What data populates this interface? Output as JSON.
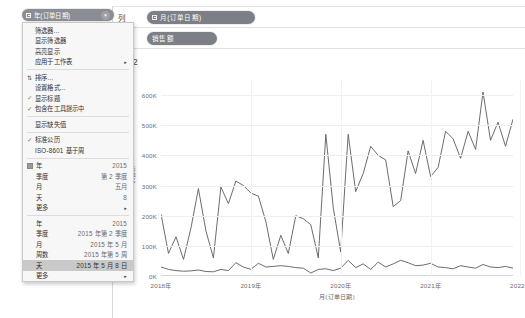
{
  "shelves": {
    "columns_label": "列",
    "rows_label": "行",
    "columns_pill": "月(订单日期)",
    "rows_pill": "销售额"
  },
  "sheet": {
    "title": "8-2"
  },
  "context_menu": {
    "header_pill": "年(订单日期)",
    "groups": [
      {
        "items": [
          {
            "label": "筛选器...",
            "value": "",
            "check": false,
            "arrow": false
          },
          {
            "label": "显示筛选器",
            "value": "",
            "check": false,
            "arrow": false
          },
          {
            "label": "高亮显示",
            "value": "",
            "check": false,
            "arrow": false
          },
          {
            "label": "应用于工作表",
            "value": "",
            "check": false,
            "arrow": true
          }
        ]
      },
      {
        "items": [
          {
            "label": "排序...",
            "value": "",
            "check": false,
            "arrow": false,
            "icon": "sort-icon"
          },
          {
            "label": "设置格式...",
            "value": "",
            "check": false,
            "arrow": false
          },
          {
            "label": "显示标题",
            "value": "",
            "check": true,
            "arrow": false
          },
          {
            "label": "包含在工具提示中",
            "value": "",
            "check": true,
            "arrow": false
          }
        ]
      },
      {
        "items": [
          {
            "label": "显示缺失值",
            "value": "",
            "check": false,
            "arrow": false
          }
        ]
      },
      {
        "items": [
          {
            "label": "标准公历",
            "value": "",
            "check": true,
            "arrow": false
          },
          {
            "label": "ISO-8601 基于周",
            "value": "",
            "check": false,
            "arrow": false
          }
        ]
      }
    ],
    "date_part_group": {
      "radio": true,
      "items": [
        {
          "label": "年",
          "value": "2015",
          "arrow": false
        },
        {
          "label": "季度",
          "value": "第 2 季度",
          "arrow": false
        },
        {
          "label": "月",
          "value": "五月",
          "arrow": false
        },
        {
          "label": "天",
          "value": "8",
          "arrow": false
        },
        {
          "label": "更多",
          "value": "",
          "arrow": true
        }
      ]
    },
    "date_value_group": {
      "items": [
        {
          "label": "年",
          "value": "2015",
          "arrow": false,
          "selected": false
        },
        {
          "label": "季度",
          "value": "2015 年第 2 季度",
          "arrow": false,
          "selected": false
        },
        {
          "label": "月",
          "value": "2015 年 5 月",
          "arrow": false,
          "selected": false
        },
        {
          "label": "周数",
          "value": "2015 年第 5 周",
          "arrow": false,
          "selected": false
        },
        {
          "label": "天",
          "value": "2015 年 5 月 8 日",
          "arrow": false,
          "selected": true
        },
        {
          "label": "更多",
          "value": "",
          "arrow": true,
          "selected": false
        }
      ]
    }
  },
  "chart_data": {
    "type": "line",
    "title": "8-2",
    "xlabel": "月(订单日期)",
    "ylabel": "销售额",
    "ylim": [
      0,
      650000
    ],
    "yticks": [
      "0K",
      "100K",
      "200K",
      "300K",
      "400K",
      "500K",
      "600K"
    ],
    "ytick_values": [
      0,
      100000,
      200000,
      300000,
      400000,
      500000,
      600000
    ],
    "xticks": [
      "2018年",
      "2019年",
      "2020年",
      "2021年",
      "2022年"
    ],
    "xtick_positions": [
      0,
      12,
      24,
      36,
      48
    ],
    "grid": true,
    "legend": "none",
    "line_color": "#5b5b5b",
    "series": [
      {
        "name": "销售额",
        "values": [
          205000,
          75000,
          130000,
          55000,
          160000,
          290000,
          150000,
          60000,
          295000,
          240000,
          315000,
          300000,
          275000,
          265000,
          180000,
          55000,
          135000,
          75000,
          200000,
          190000,
          170000,
          60000,
          470000,
          225000,
          80000,
          470000,
          280000,
          340000,
          430000,
          400000,
          385000,
          230000,
          250000,
          415000,
          340000,
          450000,
          330000,
          360000,
          480000,
          455000,
          390000,
          480000,
          420000,
          610000,
          450000,
          510000,
          430000,
          520000
        ]
      },
      {
        "name": "利润",
        "values": [
          30000,
          22000,
          18000,
          16000,
          17000,
          20000,
          15000,
          14000,
          22000,
          18000,
          44000,
          30000,
          22000,
          42000,
          30000,
          32000,
          34000,
          32000,
          28000,
          26000,
          10000,
          22000,
          24000,
          18000,
          26000,
          52000,
          28000,
          40000,
          22000,
          46000,
          30000,
          40000,
          52000,
          44000,
          34000,
          36000,
          42000,
          30000,
          28000,
          24000,
          34000,
          30000,
          26000,
          38000,
          30000,
          28000,
          32000,
          26000
        ]
      }
    ]
  }
}
